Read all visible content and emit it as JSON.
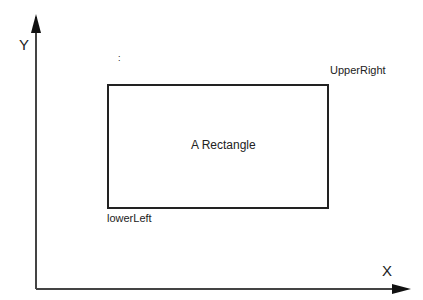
{
  "diagram": {
    "axes": {
      "x_label": "X",
      "y_label": "Y",
      "color": "#333333"
    },
    "rectangle": {
      "label": "A Rectangle",
      "lower_left_label": "lowerLeft",
      "upper_right_label": "UpperRight",
      "stroke": "#222222"
    },
    "stray_mark": ":"
  }
}
